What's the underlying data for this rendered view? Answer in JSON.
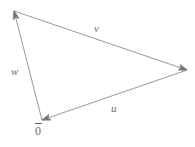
{
  "figure": {
    "background_color": "#ffffff",
    "stroke_color": "#8c8c8c",
    "label_color": "#6b6b6b"
  },
  "labels": {
    "v": "v",
    "w": "w",
    "u": "u",
    "origin": "0"
  },
  "chart_data": {
    "type": "diagram",
    "points": {
      "origin": [
        42,
        120
      ],
      "top_left": [
        14,
        11
      ],
      "right": [
        187,
        70
      ]
    },
    "vectors": [
      {
        "name": "v",
        "label": "v",
        "from": [
          14,
          11
        ],
        "to": [
          187,
          70
        ],
        "arrow_at": "to",
        "label_position": [
          99,
          29
        ]
      },
      {
        "name": "u",
        "label": "u",
        "from": [
          187,
          70
        ],
        "to": [
          42,
          120
        ],
        "arrow_at": "to",
        "label_position": [
          116,
          109
        ]
      },
      {
        "name": "w",
        "label": "w",
        "from": [
          42,
          120
        ],
        "to": [
          14,
          11
        ],
        "arrow_at": "to",
        "label_position": [
          16,
          72
        ]
      }
    ]
  }
}
